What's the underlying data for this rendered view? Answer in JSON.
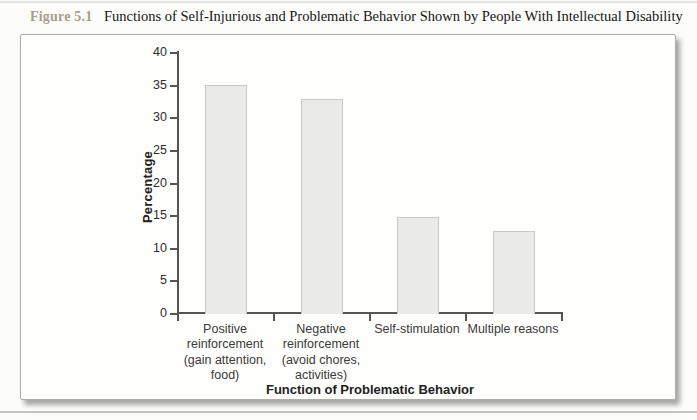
{
  "figure": {
    "label": "Figure 5.1",
    "title": "Functions of Self-Injurious and Problematic Behavior Shown by People With Intellectual Disability"
  },
  "chart_data": {
    "type": "bar",
    "title": "Functions of Self-Injurious and Problematic Behavior Shown by People With Intellectual Disability",
    "categories": [
      "Positive reinforcement (gain attention, food)",
      "Negative reinforcement (avoid chores, activities)",
      "Self-stimulation",
      "Multiple reasons"
    ],
    "values": [
      35,
      32.8,
      14.7,
      12.5
    ],
    "xlabel": "Function of Problematic Behavior",
    "ylabel": "Percentage",
    "ylim": [
      0,
      40
    ],
    "yticks": [
      0,
      5,
      10,
      15,
      20,
      25,
      30,
      35,
      40
    ],
    "grid": false,
    "legend": false
  },
  "colors": {
    "bar_fill": "#eaeae6",
    "bar_border": "#c8c8c3",
    "axis": "#555551",
    "figure_label_text": "#a89e8f"
  }
}
